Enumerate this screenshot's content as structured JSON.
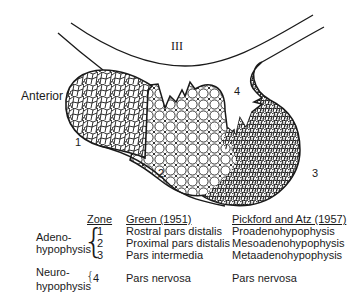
{
  "diagram": {
    "ventricle_label": "III",
    "orientation_label": "Anterior",
    "zone_labels": [
      "1",
      "2",
      "3",
      "4"
    ],
    "colors": {
      "ink": "#1a1a1a",
      "background": "#ffffff"
    }
  },
  "legend": {
    "headers": {
      "zone": "Zone",
      "green": "Green (1951)",
      "pickford": "Pickford and Atz (1957)"
    },
    "groups": [
      {
        "name_line1": "Adeno-",
        "name_line2": "hypophysis",
        "rows": [
          {
            "zone": "1",
            "green": "Rostral pars distalis",
            "pickford": "Proadenohypophysis"
          },
          {
            "zone": "2",
            "green": "Proximal pars distalis",
            "pickford": "Mesoadenohypophysis"
          },
          {
            "zone": "3",
            "green": "Pars intermedia",
            "pickford": "Metaadenohypophysis"
          }
        ]
      },
      {
        "name_line1": "Neuro-",
        "name_line2": "hypophysis",
        "rows": [
          {
            "zone": "4",
            "green": "Pars nervosa",
            "pickford": "Pars nervosa"
          }
        ]
      }
    ]
  }
}
